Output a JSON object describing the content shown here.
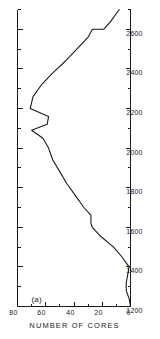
{
  "figure": {
    "panel_label": "(a)",
    "background": "#ffffff",
    "line_color": "#1a1a1a",
    "axis_color": "#1a1a1a",
    "orientation_note": "rotated"
  },
  "chart_data": {
    "type": "line",
    "title": "",
    "subtitle": "",
    "panel": "(a)",
    "xlabel": "",
    "ylabel": "NUMBER OF CORES",
    "xlim": [
      1200,
      2700
    ],
    "ylim": [
      0,
      80
    ],
    "xticks": [
      1200,
      1400,
      1600,
      1800,
      2000,
      2200,
      2400,
      2600
    ],
    "xtick_labels": [
      "1200",
      "1400",
      "1600",
      "1800",
      "2000",
      "2200",
      "2400",
      "2600"
    ],
    "yticks": [
      0,
      20,
      40,
      60,
      80
    ],
    "ytick_labels": [
      "0",
      "20",
      "40",
      "60",
      "80"
    ],
    "x_minor_tick_step": 100,
    "y_minor_tick_step": 10,
    "grid": false,
    "legend": null,
    "series": [
      {
        "name": "number of cores",
        "x": [
          1200,
          1240,
          1280,
          1320,
          1360,
          1400,
          1450,
          1500,
          1560,
          1600,
          1620,
          1660,
          1700,
          1760,
          1820,
          1880,
          1940,
          2000,
          2050,
          2090,
          2120,
          2160,
          2200,
          2260,
          2320,
          2380,
          2440,
          2500,
          2560,
          2600,
          2600,
          2640,
          2700
        ],
        "y": [
          0,
          1,
          3,
          3,
          2,
          1,
          6,
          12,
          22,
          27,
          28,
          28,
          33,
          39,
          45,
          50,
          55,
          58,
          62,
          70,
          59,
          58,
          71,
          69,
          63,
          55,
          46,
          38,
          30,
          27,
          19,
          14,
          8
        ]
      }
    ]
  },
  "axis_labels": {
    "y_axis_title": "NUMBER OF CORES",
    "x_ticks": [
      "1200",
      "1400",
      "1600",
      "1800",
      "2000",
      "2200",
      "2400",
      "2600"
    ],
    "y_ticks": [
      "0",
      "20",
      "40",
      "60",
      "80"
    ]
  }
}
